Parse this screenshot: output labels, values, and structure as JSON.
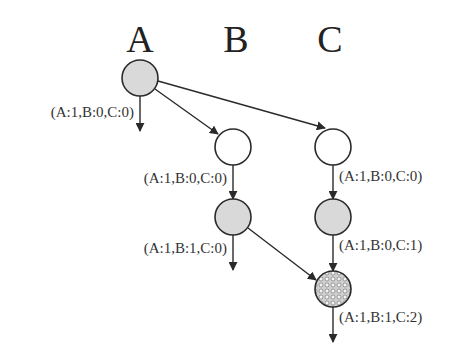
{
  "columns": [
    {
      "id": "A",
      "label": "A"
    },
    {
      "id": "B",
      "label": "B"
    },
    {
      "id": "C",
      "label": "C"
    }
  ],
  "colors": {
    "gray_fill": "#d9d9d9",
    "white_fill": "#ffffff",
    "stroke": "#2a2a2a",
    "text": "#333333"
  },
  "nodes": [
    {
      "id": "a1",
      "column": "A",
      "style": "gray",
      "label": "(A:1,B:0,C:0)"
    },
    {
      "id": "b1",
      "column": "B",
      "style": "white",
      "label": "(A:1,B:0,C:0)"
    },
    {
      "id": "c1",
      "column": "C",
      "style": "white",
      "label": "(A:1,B:0,C:0)"
    },
    {
      "id": "b2",
      "column": "B",
      "style": "gray",
      "label": "(A:1,B:1,C:0)"
    },
    {
      "id": "c2",
      "column": "C",
      "style": "gray",
      "label": "(A:1,B:0,C:1)"
    },
    {
      "id": "c3",
      "column": "C",
      "style": "hatched",
      "label": "(A:1,B:1,C:2)"
    }
  ],
  "edges": [
    {
      "from": "a1",
      "to": "b1"
    },
    {
      "from": "a1",
      "to": "c1"
    },
    {
      "from": "b1",
      "to": "b2"
    },
    {
      "from": "c1",
      "to": "c2"
    },
    {
      "from": "c2",
      "to": "c3"
    },
    {
      "from": "b2",
      "to": "c3"
    },
    {
      "from": "a1",
      "to": "a-out"
    },
    {
      "from": "b2",
      "to": "b-out"
    },
    {
      "from": "c3",
      "to": "c-out"
    }
  ]
}
